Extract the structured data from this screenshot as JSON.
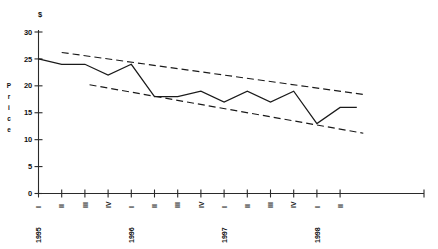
{
  "chart_data": {
    "type": "line",
    "title": "",
    "subtitle": "",
    "xlabel": "",
    "ylabel": "Price",
    "currency_symbol": "$",
    "ylim": [
      0,
      30
    ],
    "yticks": [
      0,
      5,
      10,
      15,
      20,
      25,
      30
    ],
    "ytick_labels": [
      "0",
      "5",
      "10",
      "15",
      "20",
      "25",
      "30"
    ],
    "grid": false,
    "legend": "none",
    "categories": [
      "1995 I",
      "II",
      "III",
      "IV",
      "1996 I",
      "II",
      "III",
      "IV",
      "1997 I",
      "II",
      "III",
      "IV",
      "1998 I",
      "II"
    ],
    "quarter_labels": [
      "I",
      "II",
      "III",
      "IV",
      "I",
      "II",
      "III",
      "IV",
      "I",
      "II",
      "III",
      "IV",
      "I",
      "II"
    ],
    "year_labels": [
      {
        "index": 0,
        "label": "1995"
      },
      {
        "index": 4,
        "label": "1996"
      },
      {
        "index": 8,
        "label": "1997"
      },
      {
        "index": 12,
        "label": "1998"
      }
    ],
    "series": [
      {
        "name": "Price",
        "values": [
          25,
          24,
          24,
          22,
          24,
          18,
          18,
          19,
          17,
          19,
          17,
          19,
          13,
          16
        ]
      }
    ],
    "extra_points": [
      {
        "after_index": 13,
        "value": 16,
        "note": "flat tail to right edge"
      }
    ],
    "annotations": [
      {
        "name": "upper-trend-line",
        "type": "dashed-trend",
        "x_start_index": 1.0,
        "y_start": 26.2,
        "x_end_index": 14.0,
        "y_end": 18.4
      },
      {
        "name": "lower-trend-line",
        "type": "dashed-trend",
        "x_start_index": 2.2,
        "y_start": 20.2,
        "x_end_index": 14.0,
        "y_end": 11.2
      }
    ]
  },
  "axes": {
    "y_axis_name": "price-axis",
    "x_axis_name": "time-axis"
  }
}
